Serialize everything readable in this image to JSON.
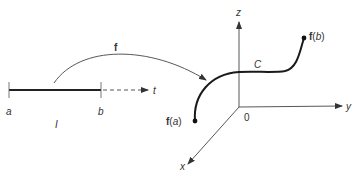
{
  "diagram": {
    "interval": {
      "start_label": "a",
      "end_label": "b",
      "name_label": "I",
      "axis_label": "t"
    },
    "mapping": {
      "label": "f"
    },
    "space": {
      "axes": {
        "x": "x",
        "y": "y",
        "z": "z",
        "origin": "0"
      },
      "curve_label": "C",
      "start_point_func": "f",
      "start_point_arg": "a",
      "end_point_func": "f",
      "end_point_arg": "b"
    },
    "colors": {
      "stroke": "#333333",
      "background": "#ffffff"
    }
  }
}
